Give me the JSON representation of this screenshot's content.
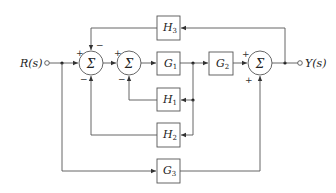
{
  "diagram": {
    "type": "control-system-block-diagram",
    "input": {
      "label": "R(s)"
    },
    "output": {
      "label": "Y(s)"
    },
    "summing_junction_symbol": "Σ",
    "blocks": [
      {
        "id": "G1",
        "label": "G",
        "sub": "1"
      },
      {
        "id": "G2",
        "label": "G",
        "sub": "2"
      },
      {
        "id": "G3",
        "label": "G",
        "sub": "3"
      },
      {
        "id": "H1",
        "label": "H",
        "sub": "1"
      },
      {
        "id": "H2",
        "label": "H",
        "sub": "2"
      },
      {
        "id": "H3",
        "label": "H",
        "sub": "3"
      }
    ],
    "summers": [
      {
        "id": "S1",
        "signs": {
          "left": "+",
          "top": "−",
          "bottom": "−"
        }
      },
      {
        "id": "S2",
        "signs": {
          "left": "+",
          "bottom": "−"
        }
      },
      {
        "id": "S3",
        "signs": {
          "left": "+",
          "bottom": "+"
        }
      }
    ],
    "edges": [
      "R(s) → S1 (+)",
      "S1 → S2 (+)",
      "S2 → G1",
      "G1 → G2",
      "G2 → S3 (+)",
      "S3 → Y(s)",
      "Y(s) → H3 → S1 (−)",
      "G1 output → H1 → S2 (−)",
      "G1 output → H2 → S1 (−)",
      "R(s) → G3 → S3 (+)"
    ]
  }
}
